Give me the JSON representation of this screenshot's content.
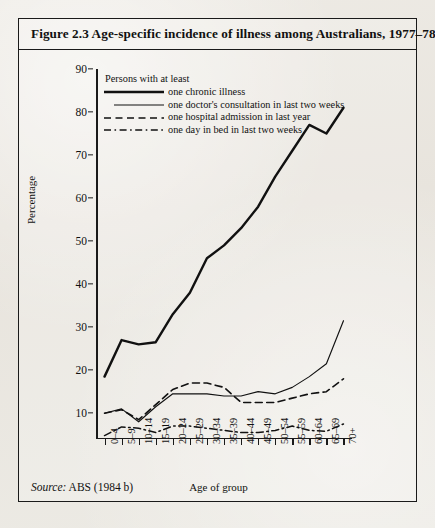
{
  "figure": {
    "title": "Figure 2.3  Age-specific incidence of illness among Australians, 1977–78",
    "source_label": "Source:",
    "source_value": "ABS (1984 b)"
  },
  "legend": {
    "heading": "Persons with at least",
    "items": [
      {
        "label": "one chronic illness",
        "style": "thick-solid",
        "color": "#111111"
      },
      {
        "label": "one doctor's consultation in last two weeks",
        "style": "thin-solid",
        "color": "#111111"
      },
      {
        "label": "one hospital admission in last year",
        "style": "dashed",
        "color": "#111111"
      },
      {
        "label": "one day in bed in last two weeks",
        "style": "dash-dot",
        "color": "#111111"
      }
    ]
  },
  "chart_data": {
    "type": "line",
    "title": "Age-specific incidence of illness among Australians, 1977–78",
    "xlabel": "Age of group",
    "ylabel": "Percentage",
    "ylim": [
      4,
      90
    ],
    "yticks": [
      10,
      20,
      30,
      40,
      50,
      60,
      70,
      80,
      90
    ],
    "grid": false,
    "legend_position": "top-left-inside",
    "categories": [
      "0–4",
      "5–9",
      "10–14",
      "15–19",
      "20–24",
      "25–29",
      "30–34",
      "35–39",
      "40–44",
      "45–49",
      "50–54",
      "55–59",
      "60–64",
      "65–69",
      "70+"
    ],
    "series": [
      {
        "name": "one chronic illness",
        "style": "thick-solid",
        "values": [
          18.5,
          27.0,
          26.0,
          26.5,
          33.0,
          38.0,
          46.0,
          49.0,
          53.0,
          58.0,
          65.0,
          71.0,
          77.0,
          75.0,
          81.0
        ]
      },
      {
        "name": "one doctor's consultation in last two weeks",
        "style": "thin-solid",
        "values": [
          10.0,
          11.0,
          8.0,
          11.5,
          14.5,
          14.5,
          14.5,
          14.0,
          14.0,
          15.0,
          14.5,
          16.0,
          18.5,
          21.5,
          21.5
        ]
      },
      {
        "name": "one hospital admission in last year",
        "style": "dashed",
        "values": [
          10.0,
          10.8,
          8.5,
          12.0,
          15.5,
          17.0,
          17.0,
          16.0,
          12.5,
          12.5,
          12.5,
          13.5,
          14.5,
          15.0,
          18.0
        ]
      },
      {
        "name": "one day in bed in last two weeks",
        "style": "dash-dot",
        "values": [
          4.8,
          6.8,
          6.5,
          5.5,
          7.0,
          7.0,
          6.5,
          6.0,
          5.5,
          5.5,
          6.0,
          7.0,
          6.0,
          5.8,
          7.5
        ]
      }
    ],
    "doctor_last_point": 31.5
  }
}
